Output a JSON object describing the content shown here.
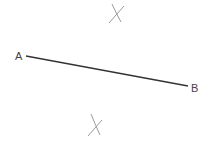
{
  "diagram": {
    "points": [
      {
        "label": "A",
        "x": 17,
        "y": 60
      },
      {
        "label": "B",
        "x": 192,
        "y": 92
      }
    ],
    "segment": {
      "from": "A",
      "to": "B",
      "color": "#333333"
    },
    "arc_marks": [
      {
        "name": "upper-intersection",
        "cx": 116,
        "cy": 14
      },
      {
        "name": "lower-intersection",
        "cx": 96,
        "cy": 125
      }
    ],
    "mark_color": "#9a9a9a"
  }
}
